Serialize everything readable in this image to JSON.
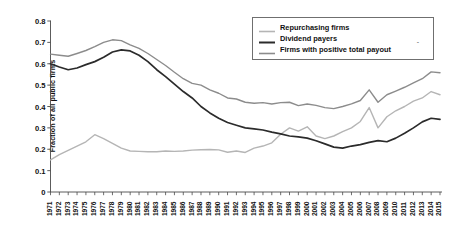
{
  "chart_data": {
    "type": "line",
    "title": "",
    "xlabel": "",
    "ylabel": "Fraction of all public firms",
    "ylim": [
      0,
      0.8
    ],
    "ytick_labels": [
      "0",
      "0.1",
      "0.2",
      "0.3",
      "0.4",
      "0.5",
      "0.6",
      "0.7",
      "0.8"
    ],
    "ytick_values": [
      0,
      0.1,
      0.2,
      0.3,
      0.4,
      0.5,
      0.6,
      0.7,
      0.8
    ],
    "grid": false,
    "legend_position": "top-right",
    "x": [
      1971,
      1972,
      1973,
      1974,
      1975,
      1976,
      1977,
      1978,
      1979,
      1980,
      1981,
      1982,
      1983,
      1984,
      1985,
      1986,
      1987,
      1988,
      1989,
      1990,
      1991,
      1992,
      1993,
      1994,
      1995,
      1996,
      1997,
      1998,
      1999,
      2000,
      2001,
      2002,
      2003,
      2004,
      2005,
      2006,
      2007,
      2008,
      2009,
      2010,
      2011,
      2012,
      2013,
      2014,
      2015
    ],
    "categories": [
      "1971",
      "1972",
      "1973",
      "1974",
      "1975",
      "1976",
      "1977",
      "1978",
      "1979",
      "1980",
      "1981",
      "1982",
      "1983",
      "1984",
      "1985",
      "1986",
      "1987",
      "1988",
      "1989",
      "1990",
      "1991",
      "1992",
      "1993",
      "1994",
      "1995",
      "1996",
      "1997",
      "1998",
      "1999",
      "2000",
      "2001",
      "2002",
      "2003",
      "2004",
      "2005",
      "2006",
      "2007",
      "2008",
      "2009",
      "2010",
      "2011",
      "2012",
      "2013",
      "2014",
      "2015"
    ],
    "series": [
      {
        "name": "Repurchasing firms",
        "color": "#b5b5b5",
        "width": 1.4,
        "values": [
          0.15,
          0.175,
          0.195,
          0.215,
          0.235,
          0.268,
          0.25,
          0.228,
          0.205,
          0.192,
          0.19,
          0.188,
          0.188,
          0.192,
          0.19,
          0.192,
          0.196,
          0.198,
          0.199,
          0.197,
          0.186,
          0.192,
          0.185,
          0.205,
          0.215,
          0.23,
          0.27,
          0.3,
          0.285,
          0.305,
          0.262,
          0.25,
          0.262,
          0.282,
          0.3,
          0.33,
          0.395,
          0.3,
          0.352,
          0.38,
          0.4,
          0.425,
          0.44,
          0.47,
          0.455
        ]
      },
      {
        "name": "Dividend payers",
        "color": "#2b2b2b",
        "width": 1.7,
        "values": [
          0.6,
          0.585,
          0.572,
          0.58,
          0.596,
          0.61,
          0.63,
          0.655,
          0.665,
          0.66,
          0.64,
          0.61,
          0.572,
          0.54,
          0.505,
          0.47,
          0.44,
          0.4,
          0.37,
          0.345,
          0.325,
          0.312,
          0.3,
          0.295,
          0.29,
          0.28,
          0.272,
          0.262,
          0.258,
          0.252,
          0.24,
          0.225,
          0.21,
          0.205,
          0.215,
          0.222,
          0.232,
          0.24,
          0.235,
          0.252,
          0.275,
          0.3,
          0.328,
          0.345,
          0.34
        ]
      },
      {
        "name": "Firms with positive total payout",
        "color": "#8c8c8c",
        "width": 1.4,
        "values": [
          0.645,
          0.64,
          0.635,
          0.648,
          0.662,
          0.68,
          0.7,
          0.712,
          0.708,
          0.688,
          0.672,
          0.648,
          0.62,
          0.592,
          0.56,
          0.53,
          0.508,
          0.5,
          0.478,
          0.462,
          0.44,
          0.435,
          0.42,
          0.415,
          0.418,
          0.412,
          0.418,
          0.42,
          0.404,
          0.412,
          0.405,
          0.395,
          0.39,
          0.4,
          0.412,
          0.428,
          0.478,
          0.42,
          0.455,
          0.472,
          0.49,
          0.51,
          0.53,
          0.562,
          0.558
        ]
      }
    ]
  },
  "legend": {
    "items": [
      {
        "label": "Repurchasing firms"
      },
      {
        "label": "Dividend payers"
      },
      {
        "label": "Firms with positive total payout"
      }
    ],
    "stray_dash": "-"
  },
  "axis": {
    "y_title": "Fraction of all public firms"
  }
}
